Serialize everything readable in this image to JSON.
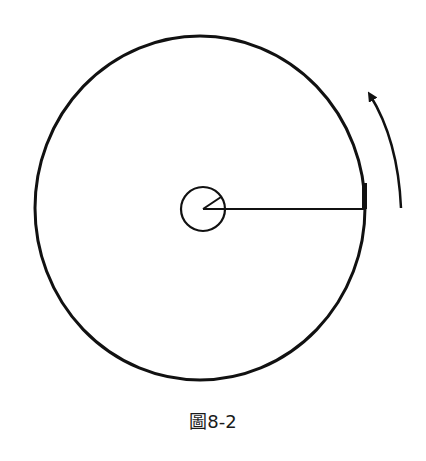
{
  "figure": {
    "caption": "圖8-2",
    "stroke_color": "#111111",
    "elements": {
      "outer_circle": "large wheel / rotating disk",
      "inner_circle": "small hub at center",
      "radius_line": "radius from hub center to rim",
      "rim_marker": "small mark on rim at end of radius",
      "rotation_arrow": "counter-clockwise rotation direction arrow"
    }
  }
}
